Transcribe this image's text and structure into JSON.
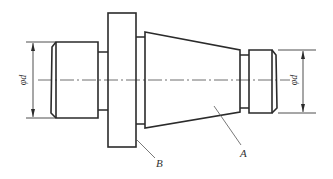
{
  "figure": {
    "type": "mechanical-part-drawing",
    "colors": {
      "background": "#ffffff",
      "line": "#2b2b2b"
    }
  },
  "dimensions": {
    "left_diameter": "φd",
    "right_diameter": "φd"
  },
  "labels": {
    "flange": "B",
    "taper": "A"
  }
}
